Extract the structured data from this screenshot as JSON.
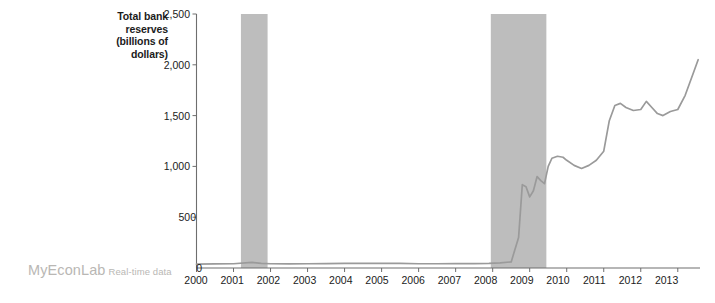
{
  "chart_data": {
    "type": "line",
    "title": "",
    "ylabel": "Total bank reserves (billions of dollars)",
    "ylabel_lines": [
      "Total bank",
      "reserves",
      "(billions of",
      "dollars)"
    ],
    "xlabel": "",
    "xlim": [
      2000,
      2013.6
    ],
    "ylim": [
      0,
      2500
    ],
    "grid": false,
    "legend": "none",
    "line_color": "#9a9a9a",
    "shade_color": "#bdbdbd",
    "axis_color": "#6e6e6e",
    "yticks": [
      0,
      500,
      1000,
      1500,
      2000,
      2500
    ],
    "ytick_labels": [
      "0",
      "500",
      "1,000",
      "1,500",
      "2,000",
      "2,500"
    ],
    "xticks": [
      2000,
      2001,
      2002,
      2003,
      2004,
      2005,
      2006,
      2007,
      2008,
      2009,
      2010,
      2011,
      2012,
      2013
    ],
    "xtick_labels": [
      "2000",
      "2001",
      "2002",
      "2003",
      "2004",
      "2005",
      "2006",
      "2007",
      "2008",
      "2009",
      "2010",
      "2011",
      "2012",
      "2013"
    ],
    "shaded_regions": [
      {
        "name": "recession-2001",
        "start": 2001.2,
        "end": 2001.92
      },
      {
        "name": "recession-2008",
        "start": 2007.95,
        "end": 2009.45
      }
    ],
    "series": [
      {
        "name": "Total bank reserves",
        "x": [
          2000.0,
          2000.5,
          2001.0,
          2001.5,
          2001.75,
          2002.0,
          2002.5,
          2003.0,
          2003.5,
          2004.0,
          2004.5,
          2005.0,
          2005.5,
          2006.0,
          2006.5,
          2007.0,
          2007.5,
          2007.9,
          2008.2,
          2008.5,
          2008.7,
          2008.8,
          2008.9,
          2009.0,
          2009.1,
          2009.2,
          2009.3,
          2009.4,
          2009.5,
          2009.6,
          2009.75,
          2009.9,
          2010.0,
          2010.2,
          2010.4,
          2010.6,
          2010.8,
          2011.0,
          2011.15,
          2011.3,
          2011.45,
          2011.6,
          2011.8,
          2012.0,
          2012.15,
          2012.3,
          2012.45,
          2012.6,
          2012.8,
          2013.0,
          2013.2,
          2013.4,
          2013.55
        ],
        "y": [
          38,
          40,
          42,
          55,
          45,
          42,
          40,
          42,
          44,
          46,
          45,
          45,
          45,
          42,
          42,
          43,
          44,
          45,
          50,
          60,
          300,
          820,
          800,
          700,
          760,
          900,
          860,
          830,
          1000,
          1080,
          1100,
          1090,
          1060,
          1010,
          980,
          1010,
          1060,
          1150,
          1450,
          1600,
          1620,
          1580,
          1550,
          1560,
          1640,
          1580,
          1520,
          1500,
          1540,
          1560,
          1700,
          1900,
          2050
        ]
      }
    ]
  },
  "watermark": {
    "brand": "MyEconLab",
    "subtitle": "Real-time data"
  }
}
